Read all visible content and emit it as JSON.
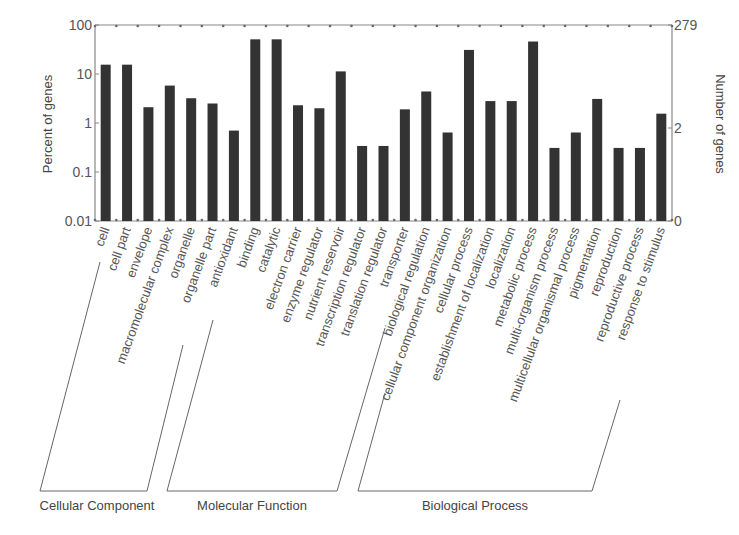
{
  "chart_data": {
    "type": "bar",
    "title": "",
    "xlabel": "",
    "ylabel": "Percent of genes",
    "ylabel_right": "Number of genes",
    "yscale": "log",
    "ylim": [
      0.01,
      100
    ],
    "yticks": [
      "0.01",
      "0.1",
      "1",
      "10",
      "100"
    ],
    "yticks_right": [
      "0",
      "2",
      "279"
    ],
    "grid": false,
    "categories": [
      "cell",
      "cell part",
      "envelope",
      "macromolecular complex",
      "organelle",
      "organelle part",
      "antioxidant",
      "binding",
      "catalytic",
      "electron carrier",
      "enzyme regulator",
      "nutrient reservoir",
      "transcription regulator",
      "translation regulator",
      "transporter",
      "biological regulation",
      "cellular component organization",
      "cellular process",
      "establishment of localization",
      "localization",
      "metabolic process",
      "multi-organism process",
      "multicellular organismal process",
      "pigmentation",
      "reproduction",
      "reproductive process",
      "response to stimulus"
    ],
    "values": [
      15.5,
      15.5,
      2.1,
      5.8,
      3.2,
      2.5,
      0.7,
      51,
      51,
      2.3,
      2.0,
      11.3,
      0.34,
      0.34,
      1.9,
      4.4,
      0.64,
      31,
      2.8,
      2.8,
      46,
      0.31,
      0.64,
      3.1,
      0.31,
      0.31,
      1.55
    ],
    "groups": [
      {
        "name": "Cellular Component",
        "start": 0,
        "end": 5
      },
      {
        "name": "Molecular Function",
        "start": 6,
        "end": 14
      },
      {
        "name": "Biological Process",
        "start": 15,
        "end": 26
      }
    ],
    "bar_color": "#333333"
  }
}
